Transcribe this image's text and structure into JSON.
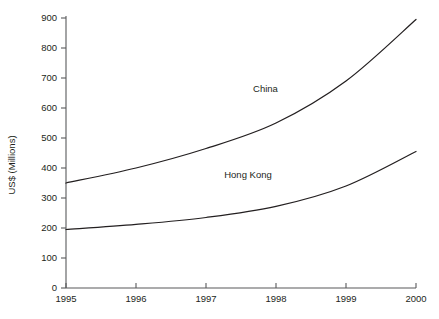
{
  "chart_data": {
    "type": "line",
    "title": "",
    "subtitle": "",
    "xlabel": "",
    "ylabel": "US$ (Millions)",
    "xlim": [
      1995,
      2000
    ],
    "ylim": [
      0,
      900
    ],
    "grid": false,
    "legend_position": "inline-labels",
    "x": [
      1995,
      1996,
      1997,
      1998,
      1999,
      2000
    ],
    "xticklabels": [
      "1995",
      "1996",
      "1997",
      "1998",
      "1999",
      "2000"
    ],
    "yticks": [
      0,
      100,
      200,
      300,
      400,
      500,
      600,
      700,
      800,
      900
    ],
    "yticklabels": [
      "0",
      "100",
      "200",
      "300",
      "400",
      "500",
      "600",
      "700",
      "800",
      "900"
    ],
    "series": [
      {
        "name": "China",
        "color": "#231f20",
        "values": [
          350,
          400,
          465,
          550,
          690,
          895
        ],
        "label_position": {
          "x": 1997.85,
          "y": 655
        }
      },
      {
        "name": "Hong Kong",
        "color": "#231f20",
        "values": [
          195,
          212,
          235,
          272,
          340,
          455
        ],
        "label_position": {
          "x": 1997.6,
          "y": 368
        }
      }
    ],
    "annotations": [
      {
        "text": "China",
        "x": 1997.85,
        "y": 655
      },
      {
        "text": "Hong Kong",
        "x": 1997.6,
        "y": 368
      }
    ]
  },
  "axis": {
    "y_title": "US$ (Millions)",
    "y_tick_labels": [
      "900",
      "800",
      "700",
      "600",
      "500",
      "400",
      "300",
      "200",
      "100",
      "0"
    ],
    "x_tick_labels": [
      "1995",
      "1996",
      "1997",
      "1998",
      "1999",
      "2000"
    ]
  },
  "labels": {
    "series_china": "China",
    "series_hong_kong": "Hong Kong"
  },
  "colors": {
    "background": "#ffffff",
    "axis": "#58595b",
    "line": "#231f20",
    "text": "#231f20"
  }
}
